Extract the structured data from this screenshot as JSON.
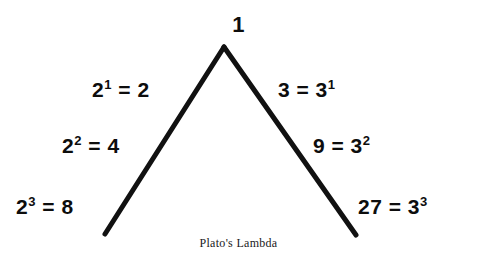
{
  "figure": {
    "caption": "Plato's Lambda",
    "apex": {
      "value": "1"
    },
    "left_branch": [
      {
        "base": "2",
        "exponent": "1",
        "result": "= 2"
      },
      {
        "base": "2",
        "exponent": "2",
        "result": "= 4"
      },
      {
        "base": "2",
        "exponent": "3",
        "result": "= 8"
      }
    ],
    "right_branch": [
      {
        "value": "3 = 3",
        "exponent": "1"
      },
      {
        "value": "9 = 3",
        "exponent": "2"
      },
      {
        "value": "27 = 3",
        "exponent": "3"
      }
    ],
    "colors": {
      "background": "#ffffff",
      "stroke": "#111111",
      "text": "#0d0d0d"
    },
    "geometry": {
      "apex_x": 224,
      "apex_y": 47,
      "left_end_x": 105,
      "left_end_y": 234,
      "right_end_x": 356,
      "right_end_y": 235,
      "stroke_width": 5
    }
  }
}
